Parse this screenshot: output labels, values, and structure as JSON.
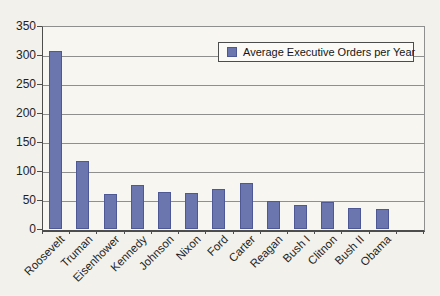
{
  "page": {
    "background_color": "#f2f1ec"
  },
  "chart_data": {
    "type": "bar",
    "title": "",
    "xlabel": "",
    "ylabel": "",
    "categories": [
      "Roosevelt",
      "Truman",
      "Eisenhower",
      "Kennedy",
      "Johnson",
      "Nixon",
      "Ford",
      "Carter",
      "Reagan",
      "Bush I",
      "Clitnon",
      "Bush II",
      "Obama"
    ],
    "values": [
      307,
      117,
      61,
      75,
      63,
      62,
      69,
      80,
      48,
      42,
      46,
      36,
      34
    ],
    "ylim": [
      0,
      350
    ],
    "yticks": [
      0,
      50,
      100,
      150,
      200,
      250,
      300,
      350
    ],
    "grid": true,
    "empty_trailing_categories": 1,
    "bar_color": "#6c76ae",
    "bar_border_color": "#4e5894",
    "legend": {
      "label": "Average Executive Orders per Year",
      "position": "top-right",
      "marker_color": "#6c76ae"
    }
  }
}
